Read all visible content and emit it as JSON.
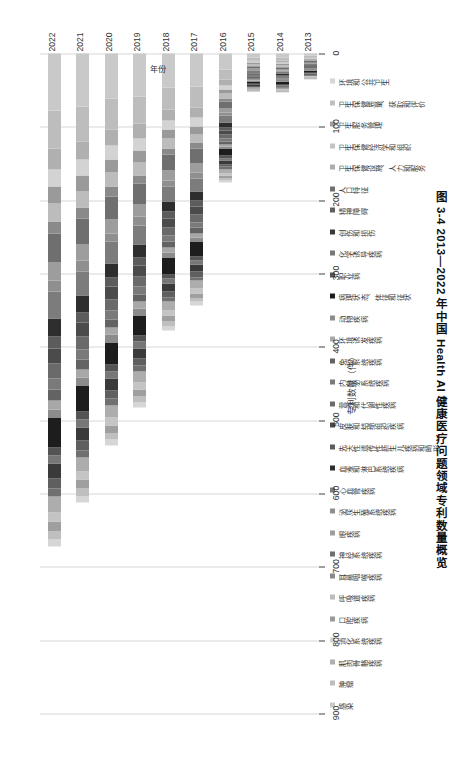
{
  "caption": "图 3-4  2013—2022 年中国 Health AI 健康医疗问题领域专利数量概览",
  "axes": {
    "x_title": "专利数量（件）",
    "y_title": "年份",
    "x_ticks": [
      "0",
      "100",
      "200",
      "300",
      "400",
      "500",
      "600",
      "700",
      "800",
      "900"
    ],
    "y_ticks": [
      "2013",
      "2014",
      "2015",
      "2016",
      "2017",
      "2018",
      "2019",
      "2020",
      "2021",
      "2022"
    ]
  },
  "chart_data": {
    "type": "bar",
    "title": "图 3-4  2013—2022 年中国 Health AI 健康医疗问题领域专利数量概览",
    "xlabel": "专利数量（件）",
    "ylabel": "年份",
    "xlim": [
      0,
      900
    ],
    "grid": true,
    "orientation": "horizontal-stacked",
    "legend_position": "top",
    "categories": [
      "2013",
      "2014",
      "2015",
      "2016",
      "2017",
      "2018",
      "2019",
      "2020",
      "2021",
      "2022"
    ],
    "series": [
      {
        "name": "感染",
        "color": "#c9c9c9",
        "values": [
          3,
          6,
          5,
          22,
          45,
          46,
          58,
          62,
          72,
          78
        ]
      },
      {
        "name": "肿瘤",
        "color": "#bdbdbd",
        "values": [
          2,
          4,
          4,
          14,
          28,
          30,
          38,
          42,
          48,
          52
        ]
      },
      {
        "name": "肌肉骨骼疾病",
        "color": "#b0b0b0",
        "values": [
          1,
          2,
          2,
          7,
          14,
          15,
          20,
          22,
          25,
          28
        ]
      },
      {
        "name": "消化系统疾病",
        "color": "#d3d3d3",
        "values": [
          1,
          2,
          2,
          6,
          12,
          13,
          17,
          19,
          22,
          24
        ]
      },
      {
        "name": "口腔疾病",
        "color": "#9a9a9a",
        "values": [
          1,
          2,
          2,
          6,
          11,
          12,
          16,
          18,
          21,
          23
        ]
      },
      {
        "name": "呼吸道疾病",
        "color": "#bcbcbc",
        "values": [
          1,
          2,
          2,
          6,
          12,
          13,
          17,
          19,
          22,
          24
        ]
      },
      {
        "name": "耳鼻咽喉疾病",
        "color": "#8a8a8a",
        "values": [
          1,
          1,
          1,
          4,
          8,
          9,
          12,
          13,
          15,
          17
        ]
      },
      {
        "name": "神经系统疾病",
        "color": "#6f6f6f",
        "values": [
          2,
          3,
          3,
          10,
          20,
          22,
          28,
          31,
          36,
          39
        ]
      },
      {
        "name": "眼疾病",
        "color": "#9d9d9d",
        "values": [
          1,
          2,
          2,
          6,
          12,
          13,
          17,
          19,
          22,
          24
        ]
      },
      {
        "name": "泌尿生殖系统疾病",
        "color": "#8f8f8f",
        "values": [
          1,
          1,
          1,
          4,
          8,
          9,
          11,
          12,
          14,
          16
        ]
      },
      {
        "name": "心血管疾病",
        "color": "#7c7c7c",
        "values": [
          2,
          3,
          3,
          9,
          18,
          20,
          26,
          29,
          33,
          36
        ]
      },
      {
        "name": "血液和淋巴系统疾病",
        "color": "#2e2e2e",
        "values": [
          1,
          2,
          2,
          7,
          13,
          14,
          18,
          20,
          23,
          25
        ]
      },
      {
        "name": "先天性遗传性新生儿疾病和畸形",
        "color": "#5c5c5c",
        "values": [
          1,
          1,
          1,
          4,
          8,
          9,
          11,
          12,
          14,
          16
        ]
      },
      {
        "name": "皮肤和结缔组织疾病",
        "color": "#4b4b4b",
        "values": [
          1,
          2,
          2,
          6,
          11,
          12,
          15,
          17,
          19,
          21
        ]
      },
      {
        "name": "营养和代谢性疾病",
        "color": "#6a6a6a",
        "values": [
          1,
          2,
          2,
          5,
          10,
          11,
          14,
          16,
          18,
          20
        ]
      },
      {
        "name": "内分泌系统疾病",
        "color": "#7a7a7a",
        "values": [
          1,
          1,
          1,
          4,
          8,
          9,
          11,
          12,
          14,
          16
        ]
      },
      {
        "name": "免疫系统疾病",
        "color": "#636363",
        "values": [
          1,
          1,
          1,
          4,
          7,
          8,
          10,
          11,
          13,
          14
        ]
      },
      {
        "name": "环境诱发疾病",
        "color": "#a8a8a8",
        "values": [
          1,
          1,
          1,
          3,
          6,
          7,
          9,
          10,
          11,
          12
        ]
      },
      {
        "name": "动物疾病",
        "color": "#8c8c8c",
        "values": [
          1,
          1,
          1,
          3,
          6,
          7,
          9,
          10,
          11,
          12
        ]
      },
      {
        "name": "病理状态、体征和征状",
        "color": "#1d1d1d",
        "values": [
          2,
          3,
          3,
          10,
          20,
          22,
          28,
          31,
          36,
          40
        ]
      },
      {
        "name": "职业病",
        "color": "#545454",
        "values": [
          1,
          1,
          1,
          3,
          5,
          6,
          8,
          9,
          10,
          11
        ]
      },
      {
        "name": "化学诱导疾病",
        "color": "#777777",
        "values": [
          1,
          1,
          1,
          3,
          6,
          7,
          9,
          10,
          11,
          12
        ]
      },
      {
        "name": "创伤和损伤",
        "color": "#3a3a3a",
        "values": [
          1,
          2,
          2,
          5,
          10,
          11,
          14,
          16,
          18,
          20
        ]
      },
      {
        "name": "精神障碍",
        "color": "#5f5f5f",
        "values": [
          1,
          1,
          1,
          4,
          7,
          8,
          10,
          11,
          13,
          14
        ]
      },
      {
        "name": "人口特征",
        "color": "#707070",
        "values": [
          1,
          1,
          1,
          3,
          5,
          6,
          8,
          9,
          10,
          11
        ]
      },
      {
        "name": "卫生保健设施、人力和服务",
        "color": "#adadad",
        "values": [
          1,
          2,
          2,
          6,
          11,
          12,
          15,
          17,
          19,
          21
        ]
      },
      {
        "name": "卫生保健经济学和组织",
        "color": "#c4c4c4",
        "values": [
          1,
          1,
          1,
          3,
          6,
          7,
          9,
          10,
          11,
          12
        ]
      },
      {
        "name": "卫生服务管理",
        "color": "#9f9f9f",
        "values": [
          1,
          1,
          1,
          4,
          7,
          8,
          10,
          11,
          13,
          14
        ]
      },
      {
        "name": "卫生保健质量、获取和评价",
        "color": "#bfbfbf",
        "values": [
          1,
          1,
          1,
          3,
          5,
          6,
          8,
          9,
          10,
          11
        ]
      },
      {
        "name": "环境和公共卫生",
        "color": "#d6d6d6",
        "values": [
          1,
          1,
          1,
          3,
          5,
          6,
          7,
          8,
          9,
          10
        ]
      }
    ],
    "totals": [
      35,
      57,
      56,
      183,
      351,
      382,
      485,
      537,
      619,
      675
    ]
  }
}
